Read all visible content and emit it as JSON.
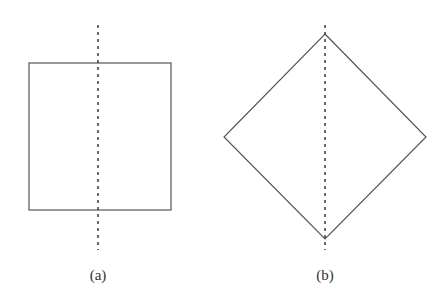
{
  "figure": {
    "panels": [
      {
        "id": "a",
        "label": "(a)",
        "shape": "square",
        "axis": "vertical dashed line through center"
      },
      {
        "id": "b",
        "label": "(b)",
        "shape": "diamond",
        "axis": "vertical dashed line through vertices"
      }
    ]
  },
  "colors": {
    "stroke": "#555555",
    "dash": "#444444",
    "text": "#333333",
    "background": "#ffffff"
  }
}
